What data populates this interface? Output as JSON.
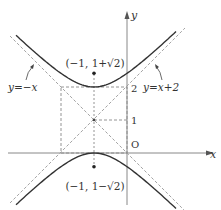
{
  "figure": {
    "type": "hyperbola-diagram",
    "equation": "(y-1)^2 - (x+1)^2 = 1",
    "axes": {
      "x_label": "x",
      "y_label": "y",
      "origin_label": "O"
    },
    "ticks": {
      "y1": "1",
      "y2": "2"
    },
    "points": [
      {
        "label": "(−1, 1+√2)",
        "x": -1,
        "y": 2.414
      },
      {
        "label": "(−1, 1−√2)",
        "x": -1,
        "y": -0.414
      }
    ],
    "asymptotes": [
      {
        "label": "y=−x",
        "slope": -1,
        "intercept": 0
      },
      {
        "label": "y=x+2",
        "slope": 1,
        "intercept": 2
      }
    ],
    "center": {
      "x": -1,
      "y": 1
    },
    "colors": {
      "curve": "#333333",
      "dash": "#888888",
      "axis": "#777777"
    }
  }
}
